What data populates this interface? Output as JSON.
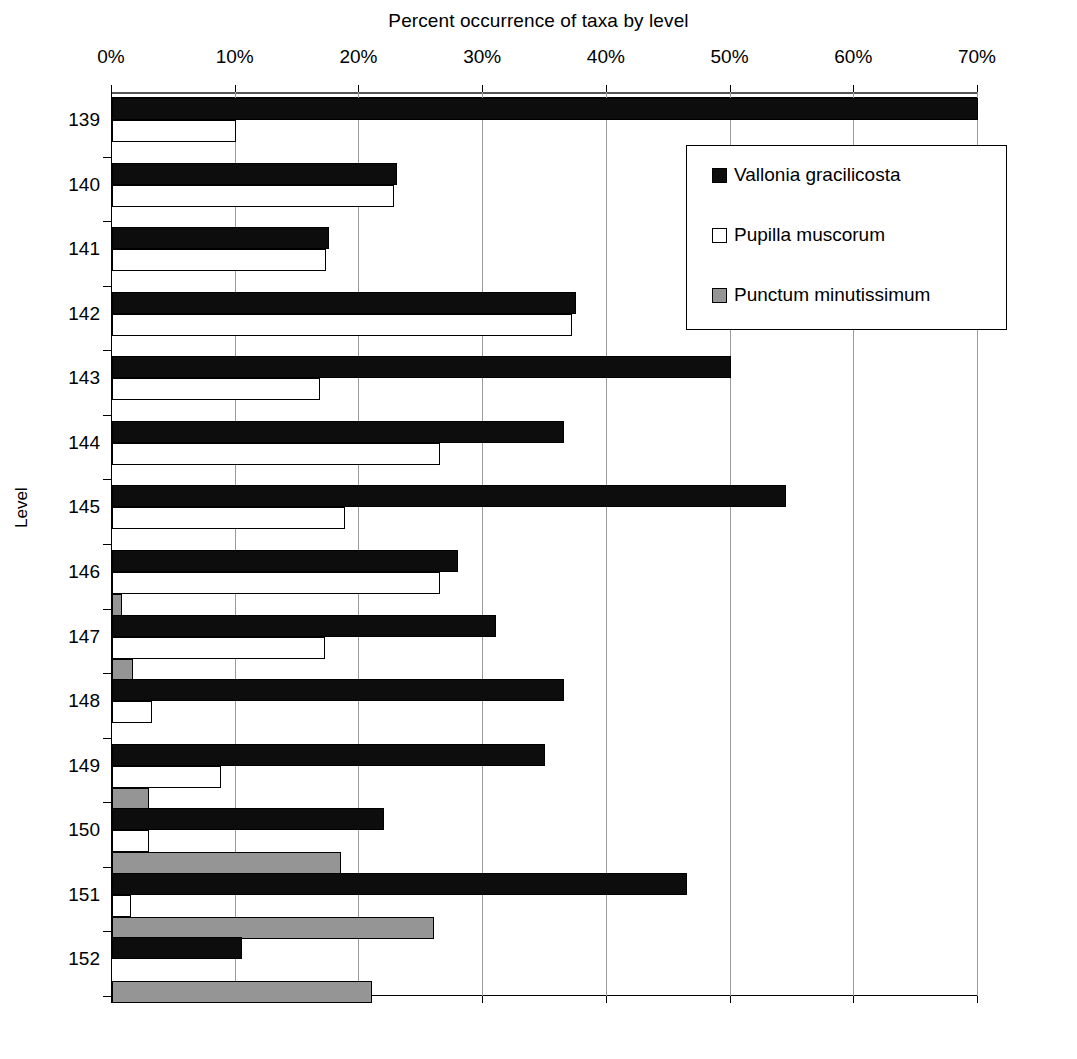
{
  "chart_data": {
    "type": "bar",
    "orientation": "horizontal",
    "title": "Percent occurrence of taxa by level",
    "xlabel": "",
    "ylabel": "Level",
    "xlim": [
      0,
      70
    ],
    "xticks": [
      0,
      10,
      20,
      30,
      40,
      50,
      60,
      70
    ],
    "xtick_labels": [
      "0%",
      "10%",
      "20%",
      "30%",
      "40%",
      "50%",
      "60%",
      "70%"
    ],
    "grid": true,
    "legend_position": "upper right",
    "categories": [
      "139",
      "140",
      "141",
      "142",
      "143",
      "144",
      "145",
      "146",
      "147",
      "148",
      "149",
      "150",
      "151",
      "152"
    ],
    "series": [
      {
        "name": "Vallonia gracilicosta",
        "color": "#0d0d0d",
        "values": [
          70.0,
          23.0,
          17.5,
          37.5,
          50.0,
          36.5,
          54.5,
          28.0,
          31.0,
          36.5,
          35.0,
          22.0,
          46.5,
          10.5
        ]
      },
      {
        "name": "Pupilla muscorum",
        "color": "#ffffff",
        "values": [
          10.0,
          22.8,
          17.3,
          37.2,
          16.8,
          26.5,
          18.8,
          26.5,
          17.2,
          3.2,
          8.8,
          3.0,
          1.5,
          0.0
        ]
      },
      {
        "name": "Punctum minutissimum",
        "color": "#959595",
        "values": [
          0.0,
          0.0,
          0.0,
          0.0,
          0.0,
          0.0,
          0.0,
          0.8,
          1.7,
          0.0,
          3.0,
          18.5,
          26.0,
          21.0
        ]
      }
    ]
  },
  "legend": {
    "items": [
      {
        "label": "Vallonia gracilicosta",
        "swatch": "black"
      },
      {
        "label": "Pupilla muscorum",
        "swatch": "white"
      },
      {
        "label": "Punctum minutissimum",
        "swatch": "gray"
      }
    ]
  }
}
